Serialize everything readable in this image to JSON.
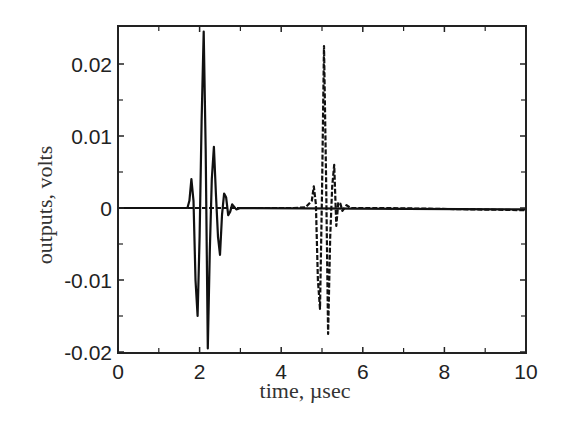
{
  "chart_data": {
    "type": "line",
    "title": "",
    "xlabel": "time, µsec",
    "ylabel": "outputs, volts",
    "xlim": [
      0,
      10
    ],
    "ylim": [
      -0.02,
      0.025
    ],
    "xticks": [
      0,
      2,
      4,
      6,
      8,
      10
    ],
    "xtick_labels": [
      "0",
      "2",
      "4",
      "6",
      "8",
      "10"
    ],
    "xminor_ticks": [
      1,
      3,
      5,
      7,
      9
    ],
    "yticks": [
      -0.02,
      -0.01,
      0,
      0.01,
      0.02
    ],
    "ytick_labels": [
      "-0.02",
      "-0.01",
      "0",
      "0.01",
      "0.02"
    ],
    "yminor_ticks": [
      -0.015,
      -0.005,
      0.005,
      0.015
    ],
    "grid": false,
    "legend": null,
    "series": [
      {
        "name": "output 1",
        "style": "solid",
        "color": "#111111",
        "points": [
          [
            0,
            0
          ],
          [
            1.7,
            0
          ],
          [
            1.75,
            0.001
          ],
          [
            1.8,
            0.004
          ],
          [
            1.85,
            0.001
          ],
          [
            1.9,
            -0.01
          ],
          [
            1.95,
            -0.015
          ],
          [
            2.0,
            -0.004
          ],
          [
            2.05,
            0.012
          ],
          [
            2.1,
            0.0245
          ],
          [
            2.15,
            0.008
          ],
          [
            2.2,
            -0.0195
          ],
          [
            2.25,
            -0.006
          ],
          [
            2.3,
            0.004
          ],
          [
            2.35,
            0.0085
          ],
          [
            2.4,
            0.002
          ],
          [
            2.45,
            -0.004
          ],
          [
            2.5,
            -0.0065
          ],
          [
            2.55,
            -0.001
          ],
          [
            2.6,
            0.002
          ],
          [
            2.65,
            0.0015
          ],
          [
            2.7,
            -0.001
          ],
          [
            2.75,
            -0.0005
          ],
          [
            2.8,
            0.0005
          ],
          [
            2.9,
            -0.0002
          ],
          [
            3.0,
            0
          ],
          [
            10,
            -0.0002
          ]
        ]
      },
      {
        "name": "output 2",
        "style": "dashed",
        "color": "#111111",
        "points": [
          [
            0,
            0
          ],
          [
            4.3,
            0
          ],
          [
            4.6,
            0.0001
          ],
          [
            4.75,
            0.001
          ],
          [
            4.8,
            0.003
          ],
          [
            4.85,
            0.0005
          ],
          [
            4.9,
            -0.01
          ],
          [
            4.95,
            -0.014
          ],
          [
            5.0,
            0.002
          ],
          [
            5.05,
            0.0225
          ],
          [
            5.1,
            0.004
          ],
          [
            5.15,
            -0.0175
          ],
          [
            5.2,
            -0.004
          ],
          [
            5.25,
            0.003
          ],
          [
            5.3,
            0.006
          ],
          [
            5.35,
            -0.0025
          ],
          [
            5.4,
            0.0008
          ],
          [
            5.45,
            0.0006
          ],
          [
            5.5,
            -0.0004
          ],
          [
            5.6,
            0.0004
          ],
          [
            5.7,
            0
          ],
          [
            6.5,
            0
          ],
          [
            10,
            -0.0003
          ]
        ]
      }
    ]
  }
}
